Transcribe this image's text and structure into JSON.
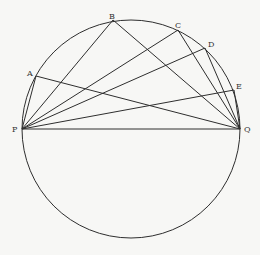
{
  "diagram": {
    "background": "#f7f7f5",
    "stroke_color": "#2e2e2e",
    "circle": {
      "cx": 131,
      "cy": 129,
      "r": 109
    },
    "points": {
      "P": {
        "x": 22,
        "y": 129,
        "label": "P",
        "lx": 12,
        "ly": 132
      },
      "Q": {
        "x": 240,
        "y": 129,
        "label": "Q",
        "lx": 244,
        "ly": 132
      },
      "A": {
        "x": 36,
        "y": 76,
        "label": "A",
        "lx": 27,
        "ly": 76
      },
      "B": {
        "x": 113,
        "y": 20,
        "label": "B",
        "lx": 109,
        "ly": 19
      },
      "C": {
        "x": 178,
        "y": 30,
        "label": "C",
        "lx": 175,
        "ly": 28
      },
      "D": {
        "x": 205,
        "y": 48,
        "label": "D",
        "lx": 208,
        "ly": 47
      },
      "E": {
        "x": 234,
        "y": 90,
        "label": "E",
        "lx": 236,
        "ly": 89
      }
    },
    "segments": [
      [
        "P",
        "Q"
      ],
      [
        "P",
        "A"
      ],
      [
        "P",
        "B"
      ],
      [
        "P",
        "C"
      ],
      [
        "P",
        "D"
      ],
      [
        "P",
        "E"
      ],
      [
        "Q",
        "A"
      ],
      [
        "Q",
        "B"
      ],
      [
        "Q",
        "C"
      ],
      [
        "Q",
        "D"
      ],
      [
        "Q",
        "E"
      ]
    ]
  }
}
